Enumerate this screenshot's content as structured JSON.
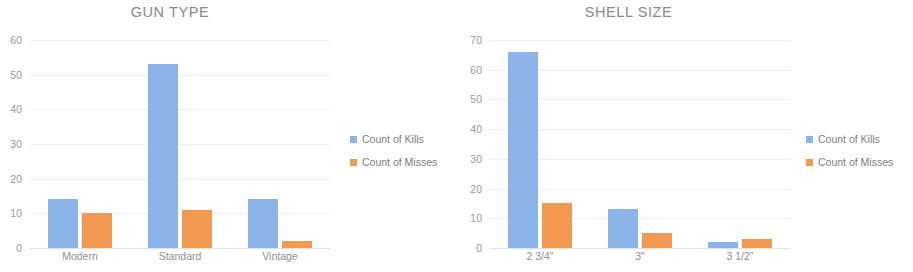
{
  "colors": {
    "kills": "#8cb4e8",
    "misses": "#f29a52",
    "grid": "#efefef",
    "text": "#8a8a8a"
  },
  "charts": [
    {
      "title": "GUN TYPE",
      "legend": [
        {
          "label": "Count of Kills"
        },
        {
          "label": "Count of Misses"
        }
      ],
      "yticks": [
        "60",
        "50",
        "40",
        "30",
        "20",
        "10",
        "0"
      ],
      "xticks": [
        "Modern",
        "Standard",
        "Vintage"
      ]
    },
    {
      "title": "SHELL SIZE",
      "legend": [
        {
          "label": "Count of Kills"
        },
        {
          "label": "Count of Misses"
        }
      ],
      "yticks": [
        "70",
        "60",
        "50",
        "40",
        "30",
        "20",
        "10",
        "0"
      ],
      "xticks": [
        "2 3/4\"",
        "3\"",
        "3 1/2\""
      ]
    }
  ],
  "chart_data": [
    {
      "type": "bar",
      "title": "GUN TYPE",
      "xlabel": "",
      "ylabel": "",
      "categories": [
        "Modern",
        "Standard",
        "Vintage"
      ],
      "series": [
        {
          "name": "Count of Kills",
          "values": [
            14,
            53,
            14
          ],
          "color": "#8cb4e8"
        },
        {
          "name": "Count of Misses",
          "values": [
            10,
            11,
            2
          ],
          "color": "#f29a52"
        }
      ],
      "ylim": [
        0,
        60
      ],
      "ytick_step": 10,
      "grid": true,
      "legend_position": "right"
    },
    {
      "type": "bar",
      "title": "SHELL SIZE",
      "xlabel": "",
      "ylabel": "",
      "categories": [
        "2 3/4\"",
        "3\"",
        "3 1/2\""
      ],
      "series": [
        {
          "name": "Count of Kills",
          "values": [
            66,
            13,
            2
          ],
          "color": "#8cb4e8"
        },
        {
          "name": "Count of Misses",
          "values": [
            15,
            5,
            3
          ],
          "color": "#f29a52"
        }
      ],
      "ylim": [
        0,
        70
      ],
      "ytick_step": 10,
      "grid": true,
      "legend_position": "right"
    }
  ]
}
